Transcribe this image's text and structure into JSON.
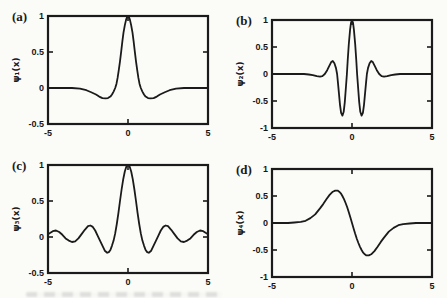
{
  "figure": {
    "background": "#fbfbf8",
    "ink_color": "#1b1b1b",
    "box_stroke_width": 2.2,
    "curve_stroke_width": 1.8
  },
  "chart_data": [
    {
      "type": "line",
      "tag": "(a)",
      "ylabel": "ψ₁(x)",
      "xlabel": "",
      "xlim": [
        -5,
        5
      ],
      "ylim": [
        -0.5,
        1
      ],
      "grid": false,
      "legend": null,
      "xticks": {
        "values": [
          -5,
          0,
          5
        ],
        "labels": [
          "-5",
          "0",
          "5"
        ]
      },
      "yticks": {
        "values": [
          1,
          0.5,
          0,
          -0.5
        ],
        "labels": [
          "1",
          "0.5",
          "0",
          "-0.5"
        ]
      },
      "x": [
        -5,
        -4,
        -3.5,
        -3,
        -2.6,
        -2.3,
        -2,
        -1.8,
        -1.6,
        -1.4,
        -1.25,
        -1.1,
        -1,
        -0.9,
        -0.8,
        -0.72,
        -0.65,
        -0.58,
        -0.5,
        -0.42,
        -0.35,
        -0.28,
        -0.2,
        -0.12,
        -0.05,
        0,
        0.05,
        0.12,
        0.2,
        0.28,
        0.35,
        0.42,
        0.5,
        0.58,
        0.65,
        0.72,
        0.8,
        0.9,
        1,
        1.1,
        1.25,
        1.4,
        1.6,
        1.8,
        2,
        2.3,
        2.6,
        3,
        3.5,
        4,
        5
      ],
      "y": [
        0,
        0,
        0,
        -0.01,
        -0.03,
        -0.06,
        -0.09,
        -0.12,
        -0.14,
        -0.145,
        -0.14,
        -0.12,
        -0.09,
        -0.05,
        0,
        0.06,
        0.14,
        0.24,
        0.37,
        0.52,
        0.65,
        0.77,
        0.87,
        0.95,
        0.99,
        1,
        0.99,
        0.95,
        0.87,
        0.77,
        0.65,
        0.52,
        0.37,
        0.24,
        0.14,
        0.06,
        0,
        -0.05,
        -0.09,
        -0.12,
        -0.14,
        -0.145,
        -0.14,
        -0.12,
        -0.09,
        -0.06,
        -0.03,
        -0.01,
        0,
        0,
        0
      ]
    },
    {
      "type": "line",
      "tag": "(b)",
      "ylabel": "ψ₂(x)",
      "xlabel": "",
      "xlim": [
        -5,
        5
      ],
      "ylim": [
        -1,
        1
      ],
      "grid": false,
      "legend": null,
      "xticks": {
        "values": [
          -5,
          0,
          5
        ],
        "labels": [
          "-5",
          "0",
          "5"
        ]
      },
      "yticks": {
        "values": [
          1,
          0.5,
          0,
          -0.5,
          -1
        ],
        "labels": [
          "1",
          "0.5",
          "0",
          "-0.5",
          "-1"
        ]
      },
      "x": [
        -5,
        -4,
        -3.5,
        -3,
        -2.7,
        -2.45,
        -2.2,
        -2,
        -1.85,
        -1.7,
        -1.55,
        -1.42,
        -1.3,
        -1.2,
        -1.1,
        -1,
        -0.93,
        -0.88,
        -0.82,
        -0.75,
        -0.68,
        -0.6,
        -0.52,
        -0.45,
        -0.38,
        -0.32,
        -0.27,
        -0.2,
        -0.12,
        -0.06,
        0,
        0.06,
        0.12,
        0.2,
        0.27,
        0.32,
        0.38,
        0.45,
        0.52,
        0.6,
        0.68,
        0.75,
        0.82,
        0.88,
        0.93,
        1,
        1.1,
        1.2,
        1.3,
        1.42,
        1.55,
        1.7,
        1.85,
        2,
        2.2,
        2.45,
        2.7,
        3,
        3.5,
        4,
        5
      ],
      "y": [
        0,
        0,
        0,
        0,
        -0.01,
        -0.02,
        -0.04,
        -0.05,
        -0.04,
        0,
        0.07,
        0.15,
        0.22,
        0.24,
        0.2,
        0.11,
        0,
        -0.15,
        -0.35,
        -0.57,
        -0.72,
        -0.77,
        -0.7,
        -0.52,
        -0.25,
        0,
        0.25,
        0.55,
        0.82,
        0.95,
        1,
        0.95,
        0.82,
        0.55,
        0.25,
        0,
        -0.25,
        -0.52,
        -0.7,
        -0.77,
        -0.72,
        -0.57,
        -0.35,
        -0.15,
        0,
        0.11,
        0.2,
        0.24,
        0.22,
        0.15,
        0.07,
        0,
        -0.04,
        -0.05,
        -0.04,
        -0.02,
        -0.01,
        0,
        0,
        0,
        0
      ]
    },
    {
      "type": "line",
      "tag": "(c)",
      "ylabel": "ψ₃(x)",
      "xlabel": "",
      "xlim": [
        -5,
        5
      ],
      "ylim": [
        -0.5,
        1
      ],
      "grid": false,
      "legend": null,
      "xticks": {
        "values": [
          -5,
          0,
          5
        ],
        "labels": [
          "-5",
          "0",
          "5"
        ]
      },
      "yticks": {
        "values": [
          1,
          0.5,
          0,
          -0.5
        ],
        "labels": [
          "1",
          "0.5",
          "0",
          "-0.5"
        ]
      },
      "x": [
        -5,
        -4.85,
        -4.7,
        -4.5,
        -4.3,
        -4.1,
        -3.9,
        -3.7,
        -3.5,
        -3.3,
        -3.1,
        -2.9,
        -2.7,
        -2.5,
        -2.35,
        -2.2,
        -2.05,
        -1.9,
        -1.75,
        -1.6,
        -1.45,
        -1.3,
        -1.2,
        -1.1,
        -1,
        -0.9,
        -0.8,
        -0.7,
        -0.6,
        -0.5,
        -0.4,
        -0.3,
        -0.2,
        -0.1,
        0,
        0.1,
        0.2,
        0.3,
        0.4,
        0.5,
        0.6,
        0.7,
        0.8,
        0.9,
        1,
        1.1,
        1.2,
        1.3,
        1.45,
        1.6,
        1.75,
        1.9,
        2.05,
        2.2,
        2.35,
        2.5,
        2.7,
        2.9,
        3.1,
        3.3,
        3.5,
        3.7,
        3.9,
        4.1,
        4.3,
        4.5,
        4.7,
        4.85,
        5
      ],
      "y": [
        0.04,
        0.06,
        0.08,
        0.09,
        0.07,
        0.03,
        -0.02,
        -0.05,
        -0.07,
        -0.06,
        -0.02,
        0.04,
        0.1,
        0.15,
        0.16,
        0.14,
        0.09,
        0.02,
        -0.05,
        -0.12,
        -0.19,
        -0.22,
        -0.21,
        -0.18,
        -0.12,
        -0.05,
        0.05,
        0.18,
        0.33,
        0.5,
        0.66,
        0.8,
        0.91,
        0.98,
        1,
        0.98,
        0.91,
        0.8,
        0.66,
        0.5,
        0.33,
        0.18,
        0.05,
        -0.05,
        -0.12,
        -0.18,
        -0.21,
        -0.22,
        -0.19,
        -0.12,
        -0.05,
        0.02,
        0.09,
        0.14,
        0.16,
        0.15,
        0.1,
        0.04,
        -0.02,
        -0.06,
        -0.07,
        -0.05,
        -0.02,
        0.03,
        0.07,
        0.09,
        0.08,
        0.06,
        0.04
      ]
    },
    {
      "type": "line",
      "tag": "(d)",
      "ylabel": "ψ₄(x)",
      "xlabel": "",
      "xlim": [
        -5,
        5
      ],
      "ylim": [
        -1,
        1
      ],
      "grid": false,
      "legend": null,
      "xticks": {
        "values": [
          -5,
          0,
          5
        ],
        "labels": [
          "-5",
          "0",
          "5"
        ]
      },
      "yticks": {
        "values": [
          1,
          0.5,
          0,
          -0.5,
          -1
        ],
        "labels": [
          "1",
          "0.5",
          "0",
          "-0.5",
          "-1"
        ]
      },
      "x": [
        -5,
        -4.5,
        -4,
        -3.6,
        -3.2,
        -2.9,
        -2.6,
        -2.3,
        -2,
        -1.8,
        -1.6,
        -1.4,
        -1.2,
        -1.05,
        -0.9,
        -0.8,
        -0.7,
        -0.6,
        -0.5,
        -0.4,
        -0.3,
        -0.2,
        -0.1,
        0,
        0.1,
        0.2,
        0.3,
        0.4,
        0.5,
        0.6,
        0.7,
        0.8,
        0.9,
        1.05,
        1.2,
        1.4,
        1.6,
        1.8,
        2,
        2.3,
        2.6,
        2.9,
        3.2,
        3.6,
        4,
        4.5,
        5
      ],
      "y": [
        0,
        0,
        0,
        0.01,
        0.02,
        0.04,
        0.09,
        0.16,
        0.27,
        0.35,
        0.44,
        0.52,
        0.58,
        0.6,
        0.6,
        0.58,
        0.55,
        0.5,
        0.44,
        0.37,
        0.29,
        0.2,
        0.1,
        0,
        -0.1,
        -0.2,
        -0.29,
        -0.37,
        -0.44,
        -0.5,
        -0.55,
        -0.58,
        -0.6,
        -0.6,
        -0.58,
        -0.52,
        -0.44,
        -0.35,
        -0.27,
        -0.16,
        -0.09,
        -0.04,
        -0.02,
        -0.01,
        0,
        0,
        0
      ]
    }
  ]
}
